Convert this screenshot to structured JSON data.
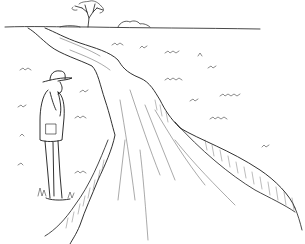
{
  "image": {
    "description": "Black-and-white line drawing of a man in a wide-brimmed hat standing at the left edge of a dirt road that winds into the distance across flat grassland, with a lone tree on the horizon.",
    "colors": {
      "background": "#ffffff",
      "ink": "#1a1a1a",
      "light_ink": "#555555"
    },
    "elements": [
      "man-with-hat",
      "dirt-road",
      "road-embankment",
      "horizon-tree",
      "distant-shrubs",
      "grass-tufts"
    ]
  }
}
